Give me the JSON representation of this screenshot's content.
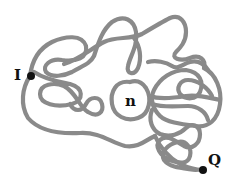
{
  "diagram": {
    "type": "tangled-curve",
    "stroke_color": "#8a8a8a",
    "point_color": "#111111",
    "labels": {
      "start": "I",
      "region": "n",
      "end": "Q"
    }
  }
}
